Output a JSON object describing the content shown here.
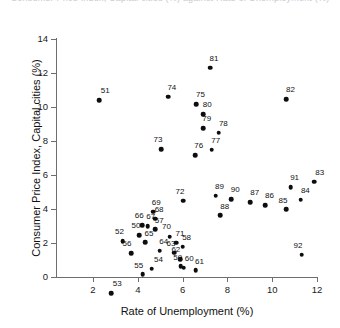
{
  "chart_data": {
    "type": "scatter",
    "title": "Consumer Price Index, Capital cities (%) against Rate of Unemployment (%)",
    "xlabel": "Rate of Unemployment (%)",
    "ylabel": "Consumer Price Index, Capital cities (%)",
    "xlim": [
      1.2,
      12.8
    ],
    "ylim": [
      -1.6,
      14.0
    ],
    "xticks": [
      2,
      4,
      6,
      8,
      10,
      12
    ],
    "xtick_labels": [
      "2",
      "4",
      "6",
      "8",
      "10",
      "12"
    ],
    "yticks": [
      0,
      2,
      4,
      6,
      8,
      10,
      12,
      14
    ],
    "ytick_labels": [
      "0",
      "2",
      "4",
      "6",
      "8",
      "10",
      "12",
      "14"
    ],
    "grid": false,
    "legend": null,
    "point_label_field": "label",
    "points": [
      {
        "label": "50",
        "x": 4.05,
        "y": 2.45,
        "lx": 3.92,
        "ly": 3.0
      },
      {
        "label": "51",
        "x": 2.28,
        "y": 10.4,
        "lx": 2.55,
        "ly": 10.95
      },
      {
        "label": "52",
        "x": 3.32,
        "y": 2.1,
        "lx": 3.18,
        "ly": 2.66
      },
      {
        "label": "53",
        "x": 2.8,
        "y": -0.95,
        "lx": 3.08,
        "ly": -0.42
      },
      {
        "label": "54",
        "x": 4.62,
        "y": 0.48,
        "lx": 4.92,
        "ly": 0.98
      },
      {
        "label": "55",
        "x": 4.22,
        "y": 0.15,
        "lx": 4.04,
        "ly": 0.66
      },
      {
        "label": "56",
        "x": 3.7,
        "y": 1.4,
        "lx": 3.52,
        "ly": 1.92
      },
      {
        "label": "57",
        "x": 4.78,
        "y": 2.8,
        "lx": 4.96,
        "ly": 3.32
      },
      {
        "label": "58",
        "x": 6.0,
        "y": 1.78,
        "lx": 6.18,
        "ly": 2.3
      },
      {
        "label": "59",
        "x": 5.92,
        "y": 0.62,
        "lx": 5.78,
        "ly": 1.12
      },
      {
        "label": "60",
        "x": 6.05,
        "y": 0.55,
        "lx": 6.3,
        "ly": 1.05
      },
      {
        "label": "61",
        "x": 6.58,
        "y": 0.4,
        "lx": 6.75,
        "ly": 0.9
      },
      {
        "label": "62",
        "x": 5.88,
        "y": 1.05,
        "lx": 5.7,
        "ly": 1.58
      },
      {
        "label": "63",
        "x": 5.62,
        "y": 1.42,
        "lx": 5.48,
        "ly": 1.95
      },
      {
        "label": "64",
        "x": 4.98,
        "y": 1.55,
        "lx": 5.16,
        "ly": 2.08
      },
      {
        "label": "65",
        "x": 4.32,
        "y": 2.05,
        "lx": 4.5,
        "ly": 2.55
      },
      {
        "label": "66",
        "x": 4.2,
        "y": 3.05,
        "lx": 4.06,
        "ly": 3.58
      },
      {
        "label": "67",
        "x": 4.45,
        "y": 2.98,
        "lx": 4.58,
        "ly": 3.52
      },
      {
        "label": "68",
        "x": 4.78,
        "y": 3.42,
        "lx": 4.95,
        "ly": 3.92
      },
      {
        "label": "69",
        "x": 4.68,
        "y": 3.85,
        "lx": 4.82,
        "ly": 4.38
      },
      {
        "label": "70",
        "x": 5.42,
        "y": 2.38,
        "lx": 5.28,
        "ly": 2.92
      },
      {
        "label": "71",
        "x": 5.72,
        "y": 2.02,
        "lx": 5.88,
        "ly": 2.55
      },
      {
        "label": "72",
        "x": 6.02,
        "y": 4.48,
        "lx": 5.88,
        "ly": 5.0
      },
      {
        "label": "73",
        "x": 5.05,
        "y": 7.52,
        "lx": 4.9,
        "ly": 8.05
      },
      {
        "label": "74",
        "x": 5.35,
        "y": 10.6,
        "lx": 5.52,
        "ly": 11.12
      },
      {
        "label": "75",
        "x": 6.62,
        "y": 10.15,
        "lx": 6.8,
        "ly": 10.68
      },
      {
        "label": "76",
        "x": 6.55,
        "y": 7.18,
        "lx": 6.72,
        "ly": 7.7
      },
      {
        "label": "77",
        "x": 7.3,
        "y": 7.48,
        "lx": 7.48,
        "ly": 8.0
      },
      {
        "label": "78",
        "x": 7.62,
        "y": 8.48,
        "lx": 7.82,
        "ly": 9.0
      },
      {
        "label": "79",
        "x": 6.92,
        "y": 8.75,
        "lx": 7.08,
        "ly": 9.3
      },
      {
        "label": "80",
        "x": 6.92,
        "y": 9.58,
        "lx": 7.1,
        "ly": 10.1
      },
      {
        "label": "81",
        "x": 7.22,
        "y": 12.3,
        "lx": 7.4,
        "ly": 12.82
      },
      {
        "label": "82",
        "x": 10.62,
        "y": 10.45,
        "lx": 10.82,
        "ly": 10.98
      },
      {
        "label": "83",
        "x": 11.88,
        "y": 5.6,
        "lx": 12.12,
        "ly": 6.12
      },
      {
        "label": "84",
        "x": 11.28,
        "y": 4.55,
        "lx": 11.48,
        "ly": 5.08
      },
      {
        "label": "85",
        "x": 10.62,
        "y": 3.98,
        "lx": 10.48,
        "ly": 4.5
      },
      {
        "label": "86",
        "x": 9.68,
        "y": 4.22,
        "lx": 9.88,
        "ly": 4.75
      },
      {
        "label": "87",
        "x": 9.02,
        "y": 4.4,
        "lx": 9.22,
        "ly": 4.92
      },
      {
        "label": "88",
        "x": 7.68,
        "y": 3.62,
        "lx": 7.88,
        "ly": 4.12
      },
      {
        "label": "89",
        "x": 7.48,
        "y": 4.78,
        "lx": 7.65,
        "ly": 5.3
      },
      {
        "label": "90",
        "x": 8.18,
        "y": 4.58,
        "lx": 8.35,
        "ly": 5.1
      },
      {
        "label": "91",
        "x": 10.82,
        "y": 5.28,
        "lx": 11.0,
        "ly": 5.8
      },
      {
        "label": "92",
        "x": 11.32,
        "y": 1.3,
        "lx": 11.15,
        "ly": 1.82
      }
    ]
  }
}
